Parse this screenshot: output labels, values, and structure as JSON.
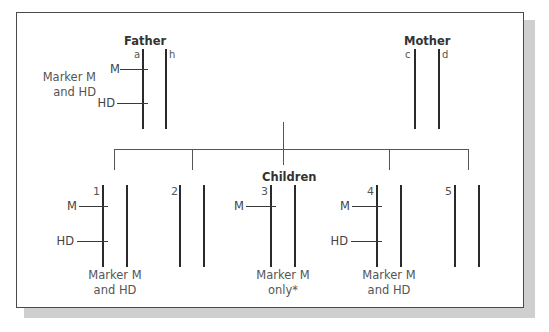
{
  "father": {
    "title": "Father",
    "chromosome_labels": [
      "a",
      "h"
    ],
    "markers": [
      "M",
      "HD"
    ],
    "caption_line1": "Marker M",
    "caption_line2": "and HD"
  },
  "mother": {
    "title": "Mother",
    "chromosome_labels": [
      "c",
      "d"
    ]
  },
  "children": {
    "title": "Children",
    "items": [
      {
        "number": "1",
        "markers": [
          "M",
          "HD"
        ],
        "caption_line1": "Marker M",
        "caption_line2": "and HD"
      },
      {
        "number": "2",
        "markers": [],
        "caption_line1": "",
        "caption_line2": ""
      },
      {
        "number": "3",
        "markers": [
          "M"
        ],
        "caption_line1": "Marker M",
        "caption_line2": "only*"
      },
      {
        "number": "4",
        "markers": [
          "M",
          "HD"
        ],
        "caption_line1": "Marker M",
        "caption_line2": "and HD"
      },
      {
        "number": "5",
        "markers": [],
        "caption_line1": "",
        "caption_line2": ""
      }
    ]
  }
}
